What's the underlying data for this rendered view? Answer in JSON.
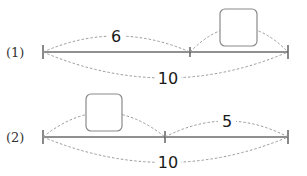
{
  "diagram": {
    "type": "tape-diagram / number line segments",
    "problems": [
      {
        "label": "(1)",
        "total": "10",
        "parts": [
          {
            "value": "6",
            "position": "left"
          },
          {
            "value": "",
            "position": "right",
            "is_blank_box": true
          }
        ]
      },
      {
        "label": "(2)",
        "total": "10",
        "parts": [
          {
            "value": "",
            "position": "left",
            "is_blank_box": true
          },
          {
            "value": "5",
            "position": "right"
          }
        ]
      }
    ]
  }
}
